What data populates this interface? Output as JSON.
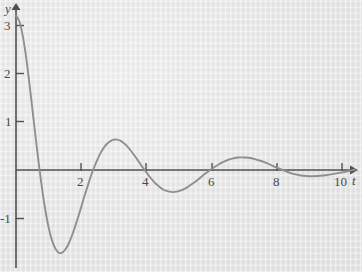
{
  "figure": {
    "type": "damped-oscillation-plot",
    "background_color": "#e8e8e8",
    "curve_color": "#8f8f8f",
    "axis_color": "#4f4f4f",
    "axis_labels": {
      "x": "t",
      "y": "y"
    },
    "y_ticks": [
      "3",
      "2",
      "1",
      "-1"
    ],
    "x_ticks": [
      "2",
      "4",
      "6",
      "8",
      "10"
    ]
  },
  "chart_data": {
    "type": "line",
    "title": "",
    "xlabel": "t",
    "ylabel": "y",
    "xlim": [
      0,
      10.6
    ],
    "ylim": [
      -2.2,
      3.3
    ],
    "grid": false,
    "legend": null,
    "x_tick_values": [
      2,
      4,
      6,
      8,
      10
    ],
    "y_tick_values": [
      3,
      2,
      1,
      -1
    ],
    "annotations": [
      {
        "label": "first maximum",
        "x": 0.3,
        "y": 3.15
      },
      {
        "label": "first minimum",
        "x": 1.35,
        "y": -1.87
      },
      {
        "label": "second maximum",
        "x": 2.4,
        "y": 1.0
      },
      {
        "label": "second minimum",
        "x": 3.95,
        "y": -0.55
      },
      {
        "label": "third maximum",
        "x": 5.0,
        "y": 0.33
      },
      {
        "label": "third minimum",
        "x": 6.0,
        "y": -0.18
      },
      {
        "label": "fourth maximum",
        "x": 7.0,
        "y": 0.1
      }
    ],
    "x": [
      0,
      0.1,
      0.2,
      0.3,
      0.4,
      0.5,
      0.6,
      0.7,
      0.8,
      0.9,
      1.0,
      1.1,
      1.2,
      1.3,
      1.4,
      1.5,
      1.6,
      1.7,
      1.8,
      1.9,
      2.0,
      2.1,
      2.2,
      2.3,
      2.4,
      2.5,
      2.6,
      2.7,
      2.8,
      2.9,
      3.0,
      3.1,
      3.2,
      3.3,
      3.4,
      3.5,
      3.6,
      3.7,
      3.8,
      3.9,
      4.0,
      4.1,
      4.2,
      4.3,
      4.4,
      4.5,
      4.6,
      4.7,
      4.8,
      4.9,
      5.0,
      5.2,
      5.4,
      5.6,
      5.8,
      6.0,
      6.2,
      6.4,
      6.6,
      6.8,
      7.0,
      7.2,
      7.4,
      7.6,
      7.8,
      8.0,
      8.5,
      9.0,
      9.5,
      10.0,
      10.4
    ],
    "y": [
      3.2,
      3.09,
      2.81,
      2.39,
      1.86,
      1.28,
      0.69,
      0.12,
      -0.39,
      -0.83,
      -1.19,
      -1.45,
      -1.62,
      -1.71,
      -1.72,
      -1.66,
      -1.55,
      -1.39,
      -1.2,
      -0.99,
      -0.77,
      -0.54,
      -0.33,
      -0.12,
      0.06,
      0.22,
      0.36,
      0.47,
      0.55,
      0.6,
      0.63,
      0.63,
      0.61,
      0.56,
      0.5,
      0.42,
      0.33,
      0.24,
      0.14,
      0.04,
      -0.05,
      -0.14,
      -0.22,
      -0.29,
      -0.35,
      -0.4,
      -0.43,
      -0.45,
      -0.46,
      -0.45,
      -0.44,
      -0.38,
      -0.29,
      -0.19,
      -0.08,
      0.02,
      0.11,
      0.18,
      0.23,
      0.26,
      0.26,
      0.25,
      0.21,
      0.17,
      0.11,
      0.05,
      -0.08,
      -0.13,
      -0.11,
      -0.05,
      0.01
    ]
  }
}
